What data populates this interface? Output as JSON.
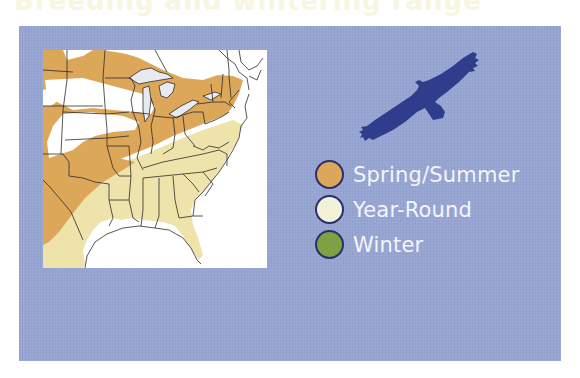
{
  "title": "Breeding and wintering range",
  "colors": {
    "panel_bg": "#97a5d3",
    "spring_summer": "#dda75a",
    "year_round": "#efe3ac",
    "winter": "#7fa043",
    "bird": "#2f3d8c",
    "map_water": "#ffffff",
    "lakes": "#e8eaf0",
    "borders": "#2b2b2b"
  },
  "map": {
    "region": "Eastern United States",
    "alt": "Range map of the eastern United States showing spring/summer and year-round ranges"
  },
  "bird": {
    "icon": "soaring-raptor-silhouette-icon"
  },
  "legend": {
    "items": [
      {
        "label": "Spring/Summer",
        "color": "#dda75a"
      },
      {
        "label": "Year-Round",
        "color": "#f4f1d9"
      },
      {
        "label": "Winter",
        "color": "#7fa043"
      }
    ]
  }
}
